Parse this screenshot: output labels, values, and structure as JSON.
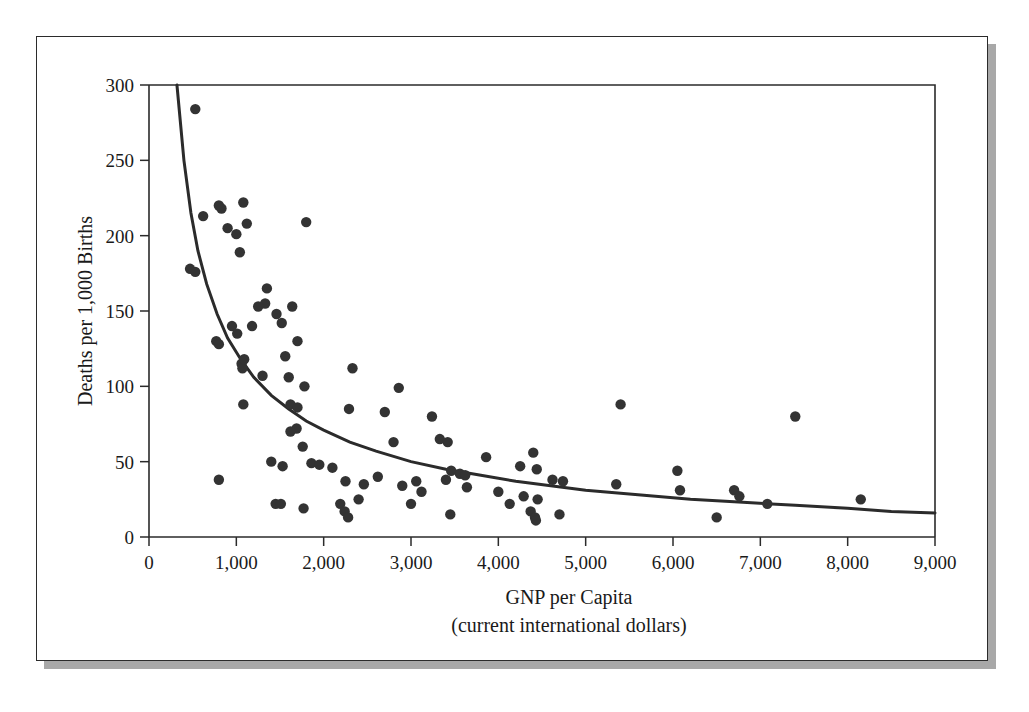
{
  "figure": {
    "frame": {
      "border_color": "#2b2b2b",
      "shadow_color": "#a8a8a8",
      "background": "#ffffff"
    }
  },
  "chart_data": {
    "type": "scatter",
    "title": "",
    "xlabel": "GNP per Capita",
    "xlabel_sub": "(current international dollars)",
    "ylabel": "Deaths per 1,000 Births",
    "xlim": [
      0,
      9000
    ],
    "ylim": [
      0,
      300
    ],
    "xticks": [
      0,
      1000,
      2000,
      3000,
      4000,
      5000,
      6000,
      7000,
      8000,
      9000
    ],
    "xticklabels": [
      "0",
      "1,000",
      "2,000",
      "3,000",
      "4,000",
      "5,000",
      "6,000",
      "7,000",
      "8,000",
      "9,000"
    ],
    "yticks": [
      0,
      50,
      100,
      150,
      200,
      250,
      300
    ],
    "yticklabels": [
      "0",
      "50",
      "100",
      "150",
      "200",
      "250",
      "300"
    ],
    "grid": false,
    "legend": null,
    "marker_color": "#333333",
    "marker_size": 5.2,
    "points": [
      [
        530,
        284
      ],
      [
        620,
        213
      ],
      [
        470,
        178
      ],
      [
        530,
        176
      ],
      [
        800,
        220
      ],
      [
        830,
        218
      ],
      [
        1080,
        222
      ],
      [
        900,
        205
      ],
      [
        1000,
        201
      ],
      [
        1120,
        208
      ],
      [
        1040,
        189
      ],
      [
        1330,
        155
      ],
      [
        1800,
        209
      ],
      [
        770,
        130
      ],
      [
        800,
        128
      ],
      [
        950,
        140
      ],
      [
        1010,
        135
      ],
      [
        1060,
        115
      ],
      [
        1070,
        112
      ],
      [
        1090,
        118
      ],
      [
        1180,
        140
      ],
      [
        1250,
        153
      ],
      [
        1350,
        165
      ],
      [
        1460,
        148
      ],
      [
        1520,
        142
      ],
      [
        1640,
        153
      ],
      [
        1700,
        130
      ],
      [
        1300,
        107
      ],
      [
        1600,
        106
      ],
      [
        1560,
        120
      ],
      [
        1780,
        100
      ],
      [
        2330,
        112
      ],
      [
        1080,
        88
      ],
      [
        1620,
        88
      ],
      [
        1700,
        86
      ],
      [
        1690,
        72
      ],
      [
        1620,
        70
      ],
      [
        2290,
        85
      ],
      [
        2860,
        99
      ],
      [
        2700,
        83
      ],
      [
        3240,
        80
      ],
      [
        2800,
        63
      ],
      [
        3330,
        65
      ],
      [
        3420,
        63
      ],
      [
        3860,
        53
      ],
      [
        4400,
        56
      ],
      [
        4250,
        47
      ],
      [
        4440,
        45
      ],
      [
        5400,
        88
      ],
      [
        7400,
        80
      ],
      [
        800,
        38
      ],
      [
        1400,
        50
      ],
      [
        1530,
        47
      ],
      [
        1760,
        60
      ],
      [
        1860,
        49
      ],
      [
        1950,
        48
      ],
      [
        2100,
        46
      ],
      [
        2460,
        35
      ],
      [
        2250,
        37
      ],
      [
        2620,
        40
      ],
      [
        3060,
        37
      ],
      [
        2900,
        34
      ],
      [
        3460,
        44
      ],
      [
        3560,
        42
      ],
      [
        3620,
        41
      ],
      [
        3640,
        33
      ],
      [
        3400,
        38
      ],
      [
        3120,
        30
      ],
      [
        4000,
        30
      ],
      [
        4290,
        27
      ],
      [
        4450,
        25
      ],
      [
        4620,
        38
      ],
      [
        4740,
        37
      ],
      [
        5350,
        35
      ],
      [
        6050,
        44
      ],
      [
        6080,
        31
      ],
      [
        6700,
        31
      ],
      [
        6760,
        27
      ],
      [
        7080,
        22
      ],
      [
        8150,
        25
      ],
      [
        6500,
        13
      ],
      [
        1450,
        22
      ],
      [
        1510,
        22
      ],
      [
        1770,
        19
      ],
      [
        2190,
        22
      ],
      [
        2240,
        17
      ],
      [
        2280,
        13
      ],
      [
        3000,
        22
      ],
      [
        3450,
        15
      ],
      [
        4370,
        17
      ],
      [
        4420,
        13
      ],
      [
        4430,
        11
      ],
      [
        4700,
        15
      ],
      [
        4130,
        22
      ],
      [
        2400,
        25
      ]
    ],
    "fit_curve": {
      "label": "hyperbolic trend line",
      "color": "#2b2b2b",
      "points": [
        [
          320,
          300
        ],
        [
          400,
          250
        ],
        [
          480,
          215
        ],
        [
          560,
          190
        ],
        [
          660,
          168
        ],
        [
          780,
          148
        ],
        [
          900,
          132
        ],
        [
          1050,
          118
        ],
        [
          1200,
          106
        ],
        [
          1400,
          94
        ],
        [
          1600,
          85
        ],
        [
          1800,
          77
        ],
        [
          2000,
          71
        ],
        [
          2300,
          63
        ],
        [
          2600,
          57
        ],
        [
          3000,
          50
        ],
        [
          3400,
          45
        ],
        [
          3800,
          41
        ],
        [
          4200,
          37
        ],
        [
          4600,
          34
        ],
        [
          5000,
          31
        ],
        [
          5600,
          28
        ],
        [
          6200,
          25
        ],
        [
          6800,
          23
        ],
        [
          7400,
          21
        ],
        [
          8000,
          19
        ],
        [
          8500,
          17
        ],
        [
          9000,
          16
        ]
      ]
    }
  }
}
